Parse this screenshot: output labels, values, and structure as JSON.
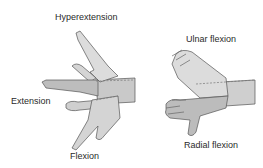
{
  "left_figure": {
    "labels": {
      "hyperextension": "Hyperextension",
      "extension": "Extension",
      "flexion": "Flexion"
    }
  },
  "right_figure": {
    "labels": {
      "ulnar_flexion": "Ulnar flexion",
      "radial_flexion": "Radial flexion"
    }
  },
  "colors": {
    "skin_light": "#d9d9d9",
    "skin_mid": "#c4c4c4",
    "skin_dark": "#a8a8a8",
    "outline": "#555555",
    "text": "#2a2a2a"
  }
}
